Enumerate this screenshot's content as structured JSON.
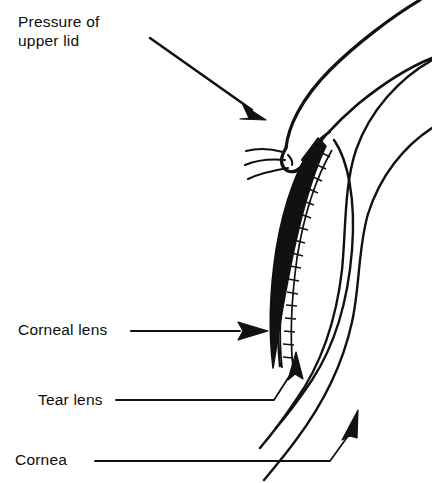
{
  "figure": {
    "type": "line-art anatomical cross-section",
    "background_color": "#ffffff",
    "ink_color": "#111111",
    "width": 432,
    "height": 483
  },
  "labels": {
    "pressure": {
      "text": "Pressure of\nupper lid",
      "line1": "Pressure of",
      "line2": "upper lid"
    },
    "corneal_lens": {
      "text": "Corneal lens"
    },
    "tear_lens": {
      "text": "Tear lens"
    },
    "cornea": {
      "text": "Cornea"
    }
  },
  "structures": {
    "upper_lid": "upper eyelid pressing on the lens",
    "eyelashes": "three curved lashes at lid margin",
    "corneal_lens": "contact lens shown as solid black crescent",
    "tear_lens": "hatched ladder band of tear fluid between lens and cornea",
    "cornea": "layered corneal arcs forming the globe"
  },
  "leaders": {
    "pressure_arrow": "diagonal arrow pointing down-right to the lid",
    "corneal_lens_arrow": "horizontal arrow pointing right to the lens body",
    "tear_lens_arrow": "bent leader pointing up-right to the hatched band",
    "cornea_arrow": "bent leader pointing up-right to the corneal band"
  }
}
